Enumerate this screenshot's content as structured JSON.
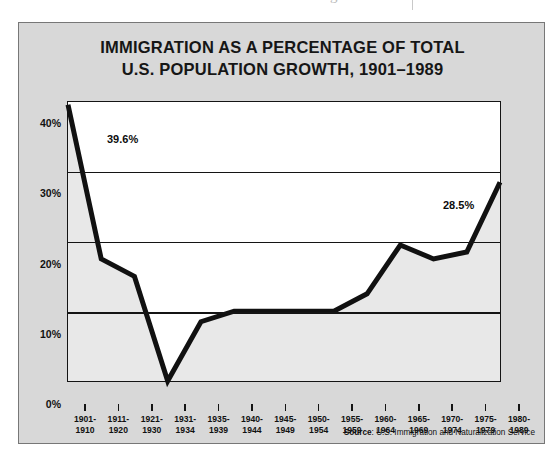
{
  "page": {
    "top_artifact_text": "g"
  },
  "figure": {
    "title_line1": "IMMIGRATION AS A PERCENTAGE OF TOTAL",
    "title_line2": "U.S. POPULATION GROWTH, 1901–1989",
    "source_label": "Source",
    "source_separator": ": ",
    "source_text": "U.S. Immigration and Naturalization Service",
    "background_color": "#d8d8d8",
    "plot_background_color": "#ffffff",
    "area_fill_color": "#e8e8e8",
    "line_color": "#111111"
  },
  "chart_data": {
    "type": "line",
    "title": "IMMIGRATION AS A PERCENTAGE OF TOTAL U.S. POPULATION GROWTH, 1901–1989",
    "xlabel": "",
    "ylabel": "",
    "ylim": [
      0,
      40
    ],
    "grid": true,
    "legend": null,
    "ytick_labels": [
      "0%",
      "10%",
      "20%",
      "30%",
      "40%"
    ],
    "ytick_values": [
      0,
      10,
      20,
      30,
      40
    ],
    "categories": [
      "1901-1910",
      "1911-1920",
      "1921-1930",
      "1931-1934",
      "1935-1939",
      "1940-1944",
      "1945-1949",
      "1950-1954",
      "1955-1959",
      "1960-1964",
      "1965-1969",
      "1970-1974",
      "1975-1979",
      "1980-1989"
    ],
    "category_lines": [
      [
        "1901-",
        "1910"
      ],
      [
        "1911-",
        "1920"
      ],
      [
        "1921-",
        "1930"
      ],
      [
        "1931-",
        "1934"
      ],
      [
        "1935-",
        "1939"
      ],
      [
        "1940-",
        "1944"
      ],
      [
        "1945-",
        "1949"
      ],
      [
        "1950-",
        "1954"
      ],
      [
        "1955-",
        "1959"
      ],
      [
        "1960-",
        "1964"
      ],
      [
        "1965-",
        "1969"
      ],
      [
        "1970-",
        "1974"
      ],
      [
        "1975-",
        "1979"
      ],
      [
        "1980-",
        "1989"
      ]
    ],
    "values": [
      39.6,
      17.5,
      15.0,
      0.0,
      8.5,
      10.0,
      10.0,
      10.0,
      10.0,
      12.5,
      19.5,
      17.5,
      18.5,
      28.5
    ],
    "annotations": [
      {
        "category": "1901-1910",
        "text": "39.6%",
        "value": 39.6
      },
      {
        "category": "1980-1989",
        "text": "28.5%",
        "value": 28.5
      }
    ]
  }
}
